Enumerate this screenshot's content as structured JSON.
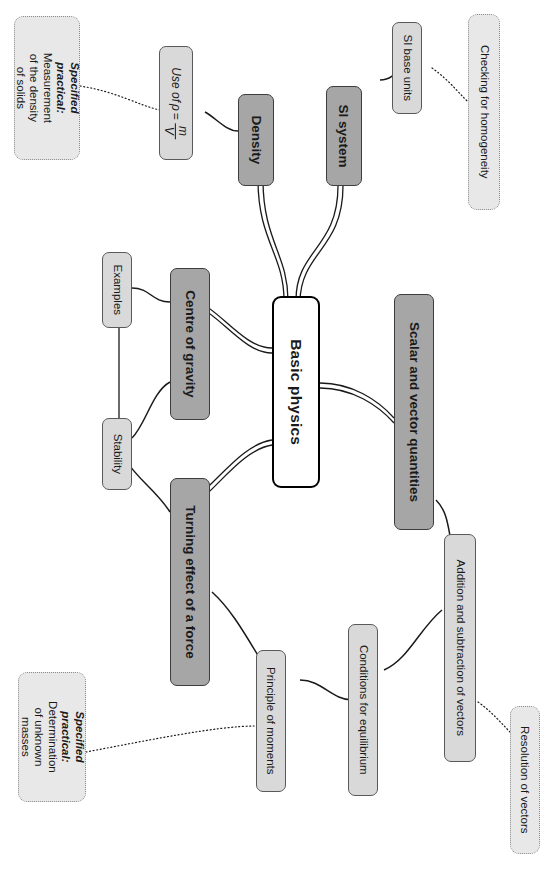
{
  "diagram": {
    "title": "Basic physics",
    "type": "mind-map",
    "orientation": "rotated-90-clockwise",
    "colors": {
      "central_fill": "#ffffff",
      "central_border": "#000000",
      "main_branch_fill": "#a6a6a6",
      "sub_branch_fill": "#d9d9d9",
      "practical_fill": "#e8e8e8",
      "practical_border": "#8c8c8c",
      "connector": "#1a1a1a",
      "background": "#ffffff"
    }
  },
  "central": {
    "label": "Basic physics"
  },
  "main_branches": [
    {
      "id": "density",
      "label": "Density"
    },
    {
      "id": "si-system",
      "label": "SI system"
    },
    {
      "id": "centre-of-gravity",
      "label": "Centre of gravity"
    },
    {
      "id": "turning-effect",
      "label": "Turning effect of a force"
    },
    {
      "id": "scalar-vector",
      "label": "Scalar and vector quantities"
    }
  ],
  "sub_branches": [
    {
      "id": "use-of-rho",
      "label": "Use of ρ = m/V",
      "formula": {
        "prefix": "Use of",
        "symbol": "ρ",
        "equals": "=",
        "numerator": "m",
        "denominator": "V"
      }
    },
    {
      "id": "si-base-units",
      "label": "SI base units"
    },
    {
      "id": "examples",
      "label": "Examples"
    },
    {
      "id": "stability",
      "label": "Stability"
    },
    {
      "id": "principle-of-moments",
      "label": "Principle of moments"
    },
    {
      "id": "conditions-for-equilibrium",
      "label": "Conditions for equilibrium"
    },
    {
      "id": "addition-subtraction-vectors",
      "label": "Addition and subtraction of vectors"
    }
  ],
  "practicals": [
    {
      "id": "practical-density",
      "heading": "Specified practical:",
      "body": "Measurement of the density of solids"
    },
    {
      "id": "practical-masses",
      "heading": "Specified practical:",
      "body": "Determination of unknown masses"
    }
  ],
  "notes": [
    {
      "id": "checking-homogeneity",
      "label": "Checking for homogeneity"
    },
    {
      "id": "resolution-of-vectors",
      "label": "Resolution of vectors"
    }
  ]
}
